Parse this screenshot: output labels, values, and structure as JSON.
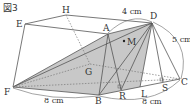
{
  "figure": {
    "title": "図3",
    "points": {
      "E": {
        "label": "E",
        "x": 25,
        "y": 24
      },
      "H": {
        "label": "H",
        "x": 66,
        "y": 15
      },
      "D": {
        "label": "D",
        "x": 152,
        "y": 23
      },
      "A": {
        "label": "A",
        "x": 108,
        "y": 34
      },
      "M": {
        "label": "M",
        "x": 124,
        "y": 41
      },
      "G": {
        "label": "G",
        "x": 90,
        "y": 64
      },
      "F": {
        "label": "F",
        "x": 13,
        "y": 87
      },
      "B": {
        "label": "B",
        "x": 99,
        "y": 95
      },
      "R": {
        "label": "R",
        "x": 121,
        "y": 90
      },
      "L": {
        "label": "L",
        "x": 140,
        "y": 87
      },
      "S": {
        "label": "S",
        "x": 163,
        "y": 82
      },
      "C": {
        "label": "C",
        "x": 180,
        "y": 79
      }
    },
    "dimensions": {
      "AD": "4 cm",
      "DC": "5 cm",
      "FB": "8 cm",
      "BC": "8 cm"
    },
    "colors": {
      "shade": "#c8c8c8",
      "line": "#555555"
    }
  }
}
